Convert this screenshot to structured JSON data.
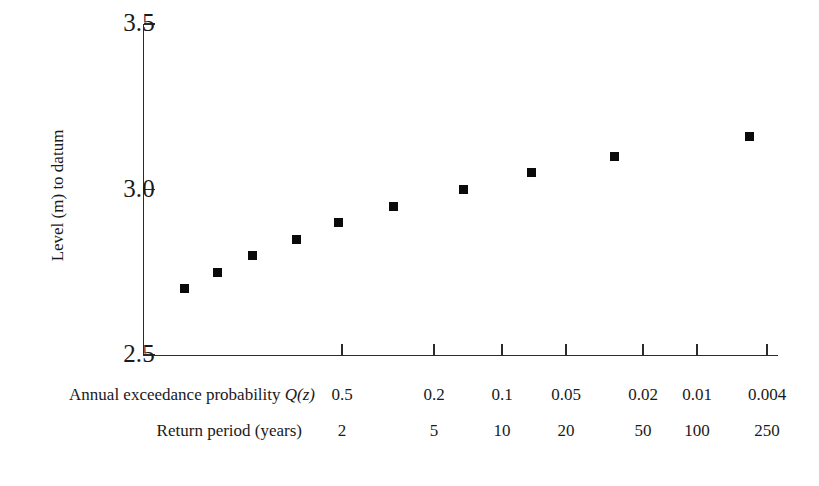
{
  "chart_data": {
    "type": "scatter",
    "title": "",
    "xlabel": "Annual exceedance probability Q(z)",
    "ylabel": "Level (m) to datum",
    "ylim": [
      2.5,
      3.5
    ],
    "y_ticks": [
      {
        "label": "3.5",
        "value": 3.5
      },
      {
        "label": "3.0",
        "value": 3.0
      },
      {
        "label": "2.5",
        "value": 2.5
      }
    ],
    "grid": false,
    "legend": null,
    "x_axis_note": "Gumbel / reduced-variate probability scale (non-linear)",
    "x_ticks": [
      {
        "probability": "0.5",
        "return_period": "2",
        "px": 342
      },
      {
        "probability": "0.2",
        "return_period": "5",
        "px": 434
      },
      {
        "probability": "0.1",
        "return_period": "10",
        "px": 502
      },
      {
        "probability": "0.05",
        "return_period": "20",
        "px": 566
      },
      {
        "probability": "0.02",
        "return_period": "50",
        "px": 643
      },
      {
        "probability": "0.01",
        "return_period": "100",
        "px": 697
      },
      {
        "probability": "0.004",
        "return_period": "250",
        "px": 767
      }
    ],
    "series": [
      {
        "name": "Annual maximum level",
        "marker": "filled-square",
        "color": "#0a0a0a",
        "points": [
          {
            "px": 184,
            "value": 2.7
          },
          {
            "px": 217,
            "value": 2.75
          },
          {
            "px": 252,
            "value": 2.8
          },
          {
            "px": 296,
            "value": 2.85
          },
          {
            "px": 338,
            "value": 2.9
          },
          {
            "px": 393,
            "value": 2.95
          },
          {
            "px": 463,
            "value": 3.0
          },
          {
            "px": 531,
            "value": 3.05
          },
          {
            "px": 614,
            "value": 3.1
          },
          {
            "px": 749,
            "value": 3.16
          }
        ]
      }
    ]
  },
  "axis": {
    "y_title": "Level (m) to datum"
  },
  "rows": {
    "probability": {
      "title_prefix": "Annual exceedance probability ",
      "title_symbol": "Q(z)",
      "values": [
        "0.5",
        "0.2",
        "0.1",
        "0.05",
        "0.02",
        "0.01",
        "0.004"
      ]
    },
    "return_period": {
      "title": "Return period (years)",
      "values": [
        "2",
        "5",
        "10",
        "20",
        "50",
        "100",
        "250"
      ]
    }
  },
  "colors": {
    "marker": "#0a0a0a",
    "axis": "#2b2b2b",
    "text": "#1a1a1a",
    "background": "#ffffff"
  }
}
